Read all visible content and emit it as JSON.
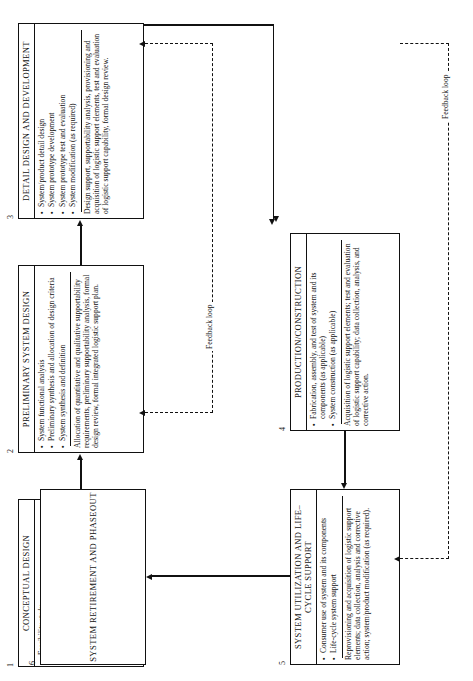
{
  "figure": {
    "orientation": "rotated-90-ccw",
    "line_color": "#111111",
    "background": "#ffffff"
  },
  "boxes": [
    {
      "number": "1",
      "title": "CONCEPTUAL DESIGN",
      "bullets": [
        "Feasibility study",
        "Operational requirements",
        "Maintenance concept",
        "Functional requirements",
        "Technical performance measures",
        "Advance system planning"
      ],
      "note": "Quantitative and qualitative supportability requirements for system, preliminary integrated logistic support plan."
    },
    {
      "number": "2",
      "title": "PRELIMINARY SYSTEM DESIGN",
      "bullets": [
        "System functional analysis",
        "Preliminary synthesis and allocation of design criteria",
        "System synthesis and definition"
      ],
      "note": "Allocation of quantitative and qualitative supportability requirements, preliminary supportability analysis, formal design review, formal integrated logistic support plan."
    },
    {
      "number": "3",
      "title": "DETAIL DESIGN AND DEVELOPMENT",
      "bullets": [
        "System/product detail design",
        "System prototype development",
        "System prototype test and evaluation",
        "System modification (as required)"
      ],
      "note": "Design support, supportability analysis, provisioning and acquisition of logistic support elements, test and evaluation of logistic support capability, formal design review."
    },
    {
      "number": "4",
      "title": "PRODUCTION/CONSTRUCTION",
      "bullets": [
        "Fabrication, assembly, and test of system and its components (as applicable)",
        "System construction (as applicable)"
      ],
      "note": "Acquisition of logistic support elements; test and evaluation of logistic support capability; data collection, analysis, and corrective action."
    },
    {
      "number": "5",
      "title": "SYSTEM UTILIZATION AND LIFE–CYCLE SUPPORT",
      "bullets": [
        "Consumer use of system and its components",
        "Life-cycle system support"
      ],
      "note": "Reprovisioning and acquisition of logistic support elements; data collection, analysis and corrective action; system/product modification (as required)."
    },
    {
      "number": "6",
      "title": "SYSTEM RETIREMENT AND PHASEOUT",
      "bullets": [],
      "note": ""
    }
  ],
  "labels": {
    "feedback_loop_upper": "Feedback loop",
    "feedback_loop_lower": "Feedback loop"
  }
}
